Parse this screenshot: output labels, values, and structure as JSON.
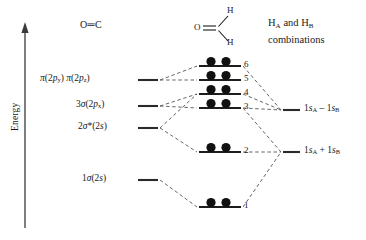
{
  "figure": {
    "type": "molecular-orbital-correlation-diagram",
    "molecule": "formaldehyde H2CO"
  },
  "axis": {
    "label": "Energy",
    "direction": "increasing upward"
  },
  "headers": {
    "left_fragment": "O═C",
    "right_fragment_line1": "H",
    "right_fragment_line2": "combinations",
    "right_fragment_full": "HA and HB combinations"
  },
  "molecule_sketch": {
    "oxygen": "O",
    "hydrogen_top": "H",
    "hydrogen_bottom": "H",
    "bond": "double"
  },
  "left_levels": [
    {
      "id": "pi2p",
      "label_html": "π(2p<sub>y</sub>) π(2p<sub>z</sub>)",
      "plain": "π(2py) π(2pz)",
      "y": 80
    },
    {
      "id": "sigma3",
      "label_html": "3σ(2p<sub>x</sub>)",
      "plain": "3σ(2px)",
      "y": 106
    },
    {
      "id": "sigma2star",
      "label_html": "2σ*(2s)",
      "plain": "2σ*(2s)",
      "y": 128
    },
    {
      "id": "sigma1",
      "label_html": "1σ(2s)",
      "plain": "1σ(2s)",
      "y": 180
    }
  ],
  "center_levels": [
    {
      "number": "6",
      "y": 66,
      "electrons": 2
    },
    {
      "number": "5",
      "y": 80,
      "electrons": 2
    },
    {
      "number": "4",
      "y": 94,
      "electrons": 2
    },
    {
      "number": "3",
      "y": 108,
      "electrons": 2
    },
    {
      "number": "2",
      "y": 152,
      "electrons": 2
    },
    {
      "number": "1",
      "y": 207,
      "electrons": 2
    }
  ],
  "right_levels": [
    {
      "id": "antisym",
      "label_html": "1<i>s</i><sub>A</sub> – 1<i>s</i><sub>B</sub>",
      "plain": "1sA - 1sB",
      "y": 110
    },
    {
      "id": "sym",
      "label_html": "1<i>s</i><sub>A</sub> + 1<i>s</i><sub>B</sub>",
      "plain": "1sA + 1sB",
      "y": 152
    }
  ],
  "colors": {
    "ink": "#1a1a1a",
    "level_line": "#2a2a2a",
    "dashed": "#555555",
    "electron": "#111111",
    "background": "#ffffff"
  }
}
